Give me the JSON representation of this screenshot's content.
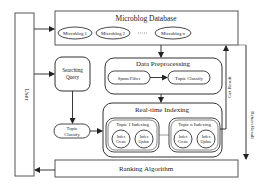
{
  "user": {
    "label": "User"
  },
  "database": {
    "title": "Microblog Database",
    "items": [
      "Microblog 1",
      "Microblog 2",
      "Microblog n"
    ],
    "ellipsis": "......"
  },
  "searching_query": {
    "line1": "Searching",
    "line2": "Query"
  },
  "preprocessing": {
    "title": "Data Preprocessing",
    "spam_filter": "Spam Filter",
    "topic_classify": "Topic Classify"
  },
  "left_topic_classify": {
    "line1": "Topic",
    "line2": "Classify"
  },
  "indexing": {
    "title": "Real-time Indexing",
    "topics": [
      {
        "title": "Topic 1 Indexing",
        "create": [
          "Index",
          "Create"
        ],
        "update": [
          "Index",
          "Update"
        ]
      },
      {
        "title": "Topic n Indexing",
        "create": [
          "Index",
          "Create"
        ],
        "update": [
          "Index",
          "Update"
        ]
      }
    ]
  },
  "ranking": {
    "label": "Ranking Algorithm"
  },
  "edges": {
    "get_result": "Get Result",
    "return_result": "Return Result"
  },
  "colors": {
    "stroke": "#333333",
    "background": "#ffffff",
    "text": "#222222"
  }
}
